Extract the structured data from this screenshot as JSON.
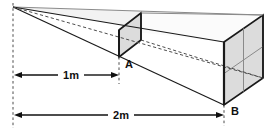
{
  "figure": {
    "background_color": "#ffffff",
    "width": 272,
    "height": 132,
    "labels": {
      "near_square_label": "A",
      "far_square_label": "B",
      "near_distance": "1m",
      "far_distance": "2m"
    },
    "colors": {
      "stroke": "#1a1a1a",
      "light_stroke": "#8a8a8a",
      "panel_fill": "#dcdcdc",
      "panel_fill_light": "#e4e4e4",
      "dash_stroke": "#4d4d4d",
      "text": "#101010"
    },
    "geometry": {
      "apex": {
        "x": 13,
        "y": 7
      },
      "near_square": {
        "name": "square-a",
        "front_bottom_left": {
          "x": 119,
          "y": 57
        },
        "front_top_left": {
          "x": 119,
          "y": 30
        },
        "back_top_right": {
          "x": 141,
          "y": 13
        },
        "back_bottom_right": {
          "x": 141,
          "y": 40
        },
        "side_length_m": 1,
        "divisions": 1
      },
      "far_square": {
        "name": "square-b",
        "front_bottom_left": {
          "x": 224,
          "y": 105
        },
        "front_top_left": {
          "x": 224,
          "y": 42
        },
        "back_top_right": {
          "x": 263,
          "y": 15
        },
        "back_bottom_right": {
          "x": 263,
          "y": 78
        },
        "side_length_m": 2,
        "divisions": 2
      },
      "dimension_lines": [
        {
          "name": "dim-1m",
          "x_start": 13,
          "x_end": 119,
          "y": 75,
          "label": "1m"
        },
        {
          "name": "dim-2m",
          "x_start": 13,
          "x_end": 224,
          "y": 115,
          "label": "2m"
        }
      ],
      "guide_dash_x": 13
    }
  }
}
